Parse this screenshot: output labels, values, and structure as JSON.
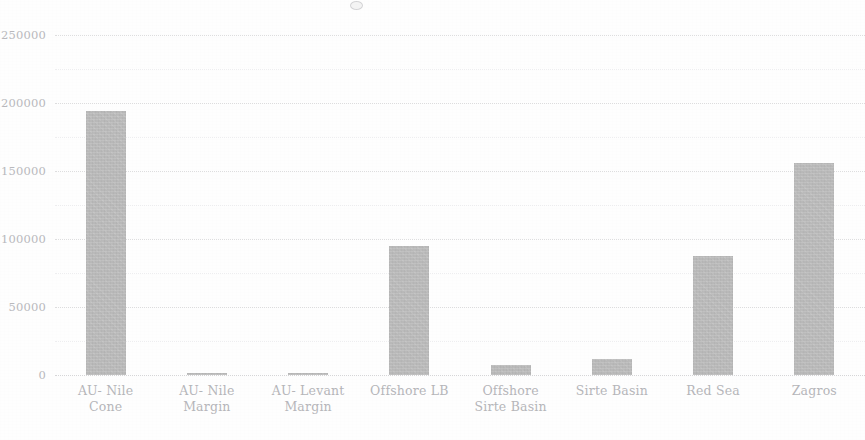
{
  "chart_data": {
    "type": "bar",
    "title": "",
    "xlabel": "",
    "ylabel": "",
    "categories": [
      "AU- Nile Cone",
      "AU- Nile Margin",
      "AU- Levant Margin",
      "Offshore LB",
      "Offshore Sirte Basin",
      "Sirte Basin",
      "Red Sea",
      "Zagros"
    ],
    "category_lines": [
      [
        "AU- Nile",
        "Cone"
      ],
      [
        "AU- Nile",
        "Margin"
      ],
      [
        "AU- Levant",
        "Margin"
      ],
      [
        "Offshore LB"
      ],
      [
        "Offshore",
        "Sirte Basin"
      ],
      [
        "Sirte Basin"
      ],
      [
        "Red Sea"
      ],
      [
        "Zagros"
      ]
    ],
    "values": [
      194000,
      1500,
      1800,
      95000,
      7000,
      12000,
      87500,
      156000
    ],
    "ylim": [
      0,
      250000
    ],
    "ytick_values": [
      0,
      50000,
      100000,
      150000,
      200000,
      250000
    ],
    "ytick_labels": [
      "0",
      "50000",
      "100000",
      "150000",
      "200000",
      "250000"
    ],
    "yminor_tick_values": [
      25000,
      75000,
      125000,
      175000,
      225000
    ],
    "grid": true,
    "grid_style": "dotted",
    "legend": "none",
    "bar_color": "#b9b9b9",
    "gridline_color": "#dededf",
    "axis_label_color": "#b6b6ba"
  },
  "axis": {
    "y_max_render": 250000,
    "y_min_render": 0
  }
}
